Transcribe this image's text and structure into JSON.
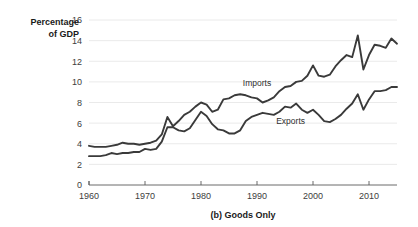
{
  "chart_data": {
    "type": "line",
    "title": "",
    "caption": "(b) Goods Only",
    "ylabel_line1": "Percentage",
    "ylabel_line2": "of GDP",
    "xlabel": "",
    "ylim": [
      0,
      16
    ],
    "xlim": [
      1960,
      2015
    ],
    "yticks": [
      0,
      2,
      4,
      6,
      8,
      10,
      12,
      14,
      16
    ],
    "ytick_labels": [
      "0",
      "2",
      "4",
      "6",
      "8",
      "10",
      "12",
      "14",
      "16"
    ],
    "xticks": [
      1960,
      1970,
      1980,
      1990,
      2000,
      2010
    ],
    "xtick_labels": [
      "1960",
      "1970",
      "1980",
      "1990",
      "2000",
      "2010"
    ],
    "grid": "horizontal",
    "legend_position": "inline-annotation",
    "line_color": "#3a3a3a",
    "grid_color": "#e4e4e4",
    "axis_color": "#5a5a5a",
    "background_color": "#ffffff",
    "x": [
      1960,
      1961,
      1962,
      1963,
      1964,
      1965,
      1966,
      1967,
      1968,
      1969,
      1970,
      1971,
      1972,
      1973,
      1974,
      1975,
      1976,
      1977,
      1978,
      1979,
      1980,
      1981,
      1982,
      1983,
      1984,
      1985,
      1986,
      1987,
      1988,
      1989,
      1990,
      1991,
      1992,
      1993,
      1994,
      1995,
      1996,
      1997,
      1998,
      1999,
      2000,
      2001,
      2002,
      2003,
      2004,
      2005,
      2006,
      2007,
      2008,
      2009,
      2010,
      2011,
      2012,
      2013,
      2014,
      2015
    ],
    "series": [
      {
        "name": "Imports",
        "label": "Imports",
        "label_x": 1990,
        "label_y": 9.6,
        "values": [
          3.8,
          3.7,
          3.7,
          3.7,
          3.8,
          3.9,
          4.1,
          4.0,
          4.0,
          3.9,
          4.0,
          4.1,
          4.3,
          4.9,
          6.6,
          5.7,
          6.2,
          6.8,
          7.1,
          7.6,
          8.0,
          7.8,
          7.1,
          7.3,
          8.3,
          8.4,
          8.7,
          8.8,
          8.7,
          8.5,
          8.4,
          8.0,
          8.2,
          8.5,
          9.1,
          9.5,
          9.6,
          10.0,
          10.1,
          10.6,
          11.6,
          10.6,
          10.5,
          10.7,
          11.5,
          12.1,
          12.6,
          12.4,
          14.5,
          11.2,
          12.6,
          13.6,
          13.5,
          13.3,
          14.2,
          13.7
        ]
      },
      {
        "name": "Exports",
        "label": "Exports",
        "label_x": 1996,
        "label_y": 5.9,
        "values": [
          2.8,
          2.8,
          2.8,
          2.9,
          3.1,
          3.0,
          3.1,
          3.1,
          3.2,
          3.2,
          3.5,
          3.4,
          3.5,
          4.2,
          5.6,
          5.6,
          5.3,
          5.2,
          5.5,
          6.3,
          7.1,
          6.7,
          5.9,
          5.4,
          5.3,
          5.0,
          5.0,
          5.3,
          6.2,
          6.6,
          6.8,
          7.0,
          6.9,
          6.8,
          7.1,
          7.6,
          7.5,
          7.9,
          7.3,
          7.0,
          7.3,
          6.8,
          6.2,
          6.1,
          6.4,
          6.8,
          7.4,
          7.9,
          8.8,
          7.3,
          8.3,
          9.1,
          9.1,
          9.2,
          9.5,
          9.5
        ]
      }
    ]
  }
}
